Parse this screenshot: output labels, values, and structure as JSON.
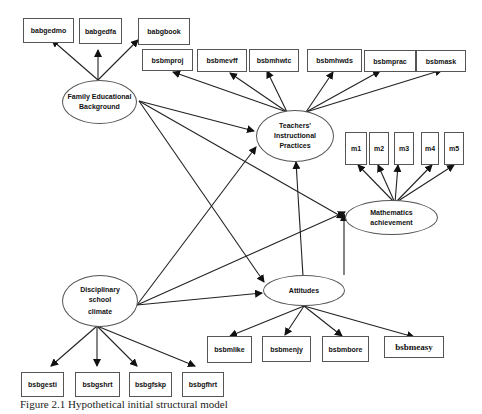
{
  "diagram": {
    "type": "structural-equation-model",
    "latent_constructs": [
      {
        "id": "feb",
        "label_lines": [
          "Family Educational",
          "Background"
        ]
      },
      {
        "id": "tip",
        "label_lines": [
          "Teachers'",
          "Instructional",
          "Practices"
        ]
      },
      {
        "id": "ma",
        "label_lines": [
          "Mathematics",
          "achievement"
        ]
      },
      {
        "id": "dsc",
        "label_lines": [
          "Disciplinary",
          "school",
          "climate"
        ]
      },
      {
        "id": "att",
        "label_lines": [
          "Attitudes"
        ]
      }
    ],
    "indicators": {
      "feb": [
        "babgedmo",
        "babgedfa",
        "babgbook"
      ],
      "tip": [
        "bsbmproj",
        "bsbmevff",
        "bsbmhwtc",
        "bsbmhwds",
        "bsbmprac",
        "bsbmask"
      ],
      "ma": [
        "m1",
        "m2",
        "m3",
        "m4",
        "m5"
      ],
      "att": [
        "bsbmlike",
        "bsbmenjy",
        "bsbmbore",
        "bsbmeasy"
      ],
      "dsc": [
        "bsbgesti",
        "bsbgshrt",
        "bsbgfskp",
        "bsbgfhrt"
      ]
    },
    "structural_paths": [
      {
        "from": "Family Educational Background",
        "to": "Teachers' Instructional Practices"
      },
      {
        "from": "Family Educational Background",
        "to": "Mathematics achievement"
      },
      {
        "from": "Family Educational Background",
        "to": "Attitudes"
      },
      {
        "from": "Disciplinary school climate",
        "to": "Teachers' Instructional Practices"
      },
      {
        "from": "Disciplinary school climate",
        "to": "Mathematics achievement"
      },
      {
        "from": "Disciplinary school climate",
        "to": "Attitudes"
      },
      {
        "from": "Attitudes",
        "to": "Teachers' Instructional Practices"
      },
      {
        "from": "Attitudes",
        "to": "Mathematics achievement"
      }
    ],
    "caption": "Figure 2.1 Hypothetical initial structural model"
  }
}
